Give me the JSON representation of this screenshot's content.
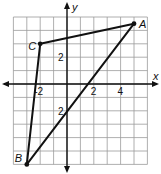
{
  "figure": {
    "type": "coordinate-plane-triangle",
    "axes": {
      "x_label": "x",
      "y_label": "y",
      "x_range": [
        -4,
        6
      ],
      "y_range": [
        -6,
        5
      ],
      "grid_step": 1
    },
    "tick_labels": [
      {
        "axis": "x",
        "value": -2,
        "text": "-2"
      },
      {
        "axis": "x",
        "value": 2,
        "text": "2"
      },
      {
        "axis": "x",
        "value": 4,
        "text": "4"
      },
      {
        "axis": "y",
        "value": 2,
        "text": "2"
      },
      {
        "axis": "y",
        "value": -2,
        "text": "2"
      }
    ],
    "points": [
      {
        "name": "A",
        "x": 5,
        "y": 4.5
      },
      {
        "name": "B",
        "x": -3,
        "y": -6
      },
      {
        "name": "C",
        "x": -2,
        "y": 3
      }
    ],
    "segments": [
      {
        "from": "A",
        "to": "B"
      },
      {
        "from": "B",
        "to": "C"
      },
      {
        "from": "C",
        "to": "A"
      }
    ],
    "colors": {
      "grid": "#9a9a9a",
      "ink": "#111111",
      "background": "#ffffff"
    }
  }
}
